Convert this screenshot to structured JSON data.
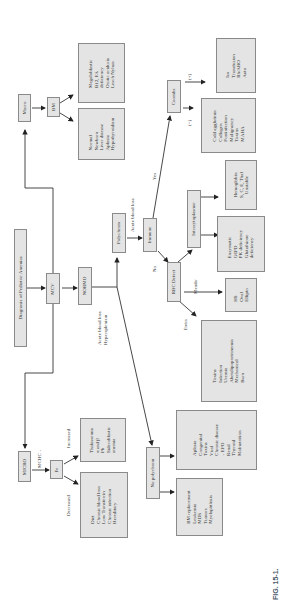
{
  "figure": {
    "caption": "FIG. 15-1.",
    "orientation": "rotated 90° counter-clockwise",
    "root": "Diagnosis of Pediatric Anemias"
  },
  "nodes": {
    "root": "Diagnosis of Pediatric Anemias",
    "mcv": "MCV",
    "micro": "MICRO",
    "normo": "NORMO",
    "macro": "Macro",
    "fe": "Fe",
    "bm": "BM",
    "polychrom": "Polychrom",
    "no_polychrom": "No polychrom",
    "immune": "Immune",
    "coombs": "Coombs",
    "rbc_defect": "RBC Defect",
    "intracytoplasmic": "Intracytoplasmic"
  },
  "edge_labels": {
    "mchc": "MCHC ↓",
    "decreased": "Decreased",
    "increased": "Increased",
    "acute_blood_loss": "Acute blood loss",
    "acute_hypersplenism": [
      "Acute blood loss",
      "Hypersplenism"
    ],
    "yes": "Yes",
    "no": "No",
    "coombs_pos": "(+)",
    "coombs_neg": "(−)",
    "membr": "Membr",
    "extra": "Extra"
  },
  "lists": {
    "bm_normal": [
      "Normal",
      "Newborn",
      "Liver disease",
      "Aplasia",
      "Hypothyroidism"
    ],
    "bm_megaloblastic": [
      "Megaloblastic",
      "B12, FA",
      "deficiency",
      "Orotic aciduria",
      "Lesch Nyhan"
    ],
    "coombs_pos": [
      "Iso",
      "Transfusion",
      "Rh/ABO",
      "Auto"
    ],
    "coombs_neg": [
      "Cold agglutinin",
      "Collagen",
      "Postinfection",
      "Malignancy",
      "Toxins",
      "MAHA"
    ],
    "intracyto_hgb": [
      "Hemoglobin",
      "S, C, E, Thal",
      "Unstable"
    ],
    "enzymatic": [
      "Enzymatic",
      "G6PD",
      "PK deficiency",
      "Glutathione",
      "deficiency"
    ],
    "membrane": [
      "HS",
      "Oval",
      "Ellipto"
    ],
    "extra": [
      "Toxins",
      "Infection",
      "Uremia",
      "Abetalipoproteinemia",
      "Mechanical",
      "Burn"
    ],
    "fe_decreased": [
      "Diet",
      "Chronic blood loss",
      "Low Transferrin",
      "Chronic infection",
      "Hereditary"
    ],
    "fe_increased": [
      "Thalassemia",
      "α and β",
      "Pb",
      "Sideroblastic",
      "anemia"
    ],
    "no_polychrom_a": [
      "Aplasia",
      "Congenital",
      "Toxins",
      "Viral",
      "Chronic disease",
      "↓ EPO",
      "Renal",
      "Thyroid",
      "Malnutrition"
    ],
    "no_polychrom_b": [
      "BM replacement",
      "Leukemia",
      "MDS",
      "Tumors",
      "Myelophthisis"
    ]
  }
}
